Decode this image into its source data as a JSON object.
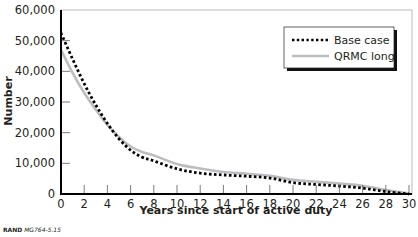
{
  "chart_data": {
    "type": "line",
    "title": "",
    "xlabel": "Years since start of active duty",
    "ylabel": "Number",
    "xlim": [
      0,
      30
    ],
    "ylim": [
      0,
      60000
    ],
    "grid": false,
    "legend_position": "upper right",
    "x_ticks": [
      0,
      2,
      4,
      6,
      8,
      10,
      12,
      14,
      16,
      18,
      20,
      22,
      24,
      26,
      28,
      30
    ],
    "x_tick_labels": [
      "0",
      "2",
      "4",
      "6",
      "8",
      "10",
      "12",
      "14",
      "16",
      "18",
      "20",
      "22",
      "24",
      "26",
      "28",
      "30"
    ],
    "y_ticks": [
      0,
      10000,
      20000,
      30000,
      40000,
      50000,
      60000
    ],
    "y_tick_labels": [
      "0",
      "10,000",
      "20,000",
      "30,000",
      "40,000",
      "50,000",
      "60,000"
    ],
    "x": [
      0,
      1,
      2,
      3,
      4,
      5,
      6,
      7,
      8,
      10,
      12,
      14,
      16,
      18,
      20,
      22,
      24,
      26,
      28,
      30
    ],
    "series": [
      {
        "name": "Base case",
        "style": "dotted",
        "color": "#000000",
        "values": [
          52500,
          44000,
          36000,
          29000,
          23000,
          18000,
          14300,
          12000,
          10800,
          8200,
          6800,
          6200,
          5800,
          5200,
          3700,
          3100,
          2600,
          1900,
          800,
          0
        ]
      },
      {
        "name": "QRMC long",
        "style": "solid",
        "color": "#bcbdc0",
        "values": [
          47000,
          39500,
          33000,
          27500,
          22500,
          18600,
          15500,
          13700,
          12600,
          9800,
          8300,
          7200,
          6600,
          5900,
          4600,
          4000,
          3400,
          2700,
          1300,
          200
        ]
      }
    ]
  },
  "legend": {
    "items": [
      {
        "label": "Base case"
      },
      {
        "label": "QRMC long"
      }
    ]
  },
  "credit": {
    "org": "RAND",
    "code": "MG764-5.15"
  }
}
